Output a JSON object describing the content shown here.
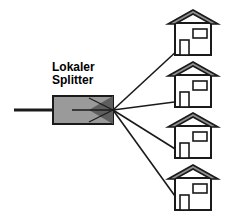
{
  "diagram": {
    "title": "Lokaler Splitter",
    "type": "optical-splitter-network",
    "canvas": {
      "width": 228,
      "height": 218,
      "background": "#ffffff"
    },
    "label": {
      "line1": "Lokaler",
      "line2": "Splitter",
      "x": 52,
      "y": 61,
      "font_size": 12,
      "font_weight": "bold",
      "color": "#000000"
    },
    "colors": {
      "stroke": "#1a1a1a",
      "splitter_fill": "#9a9a9a",
      "splitter_wedge_fill": "#5e5e5e",
      "roof_fill": "#8f8f8f",
      "house_fill": "#ffffff",
      "background": "#ffffff"
    },
    "feeder_line": {
      "label": "feeder-fiber",
      "x1": 14,
      "y1": 110,
      "x2": 70,
      "y2": 110,
      "width": 3
    },
    "splitter_box": {
      "label": "Lokaler Splitter",
      "x": 52,
      "y": 95,
      "width": 61,
      "height": 29,
      "fill": "#9a9a9a",
      "stroke_width": 2
    },
    "splitter_wedge": {
      "apex_x": 113,
      "apex_y": 110,
      "base_x": 113,
      "base_top_y": 95,
      "base_bottom_y": 124
    },
    "drop_lines": [
      {
        "name": "drop-line-1",
        "x1": 113,
        "y1": 110,
        "x2": 178,
        "y2": 48
      },
      {
        "name": "drop-line-2",
        "x1": 113,
        "y1": 110,
        "x2": 178,
        "y2": 100
      },
      {
        "name": "drop-line-3",
        "x1": 113,
        "y1": 110,
        "x2": 178,
        "y2": 150
      },
      {
        "name": "drop-line-4",
        "x1": 113,
        "y1": 110,
        "x2": 178,
        "y2": 202
      }
    ],
    "houses": [
      {
        "name": "house-1",
        "x": 168,
        "y": 10,
        "width": 48,
        "height": 45
      },
      {
        "name": "house-2",
        "x": 168,
        "y": 62,
        "width": 48,
        "height": 45
      },
      {
        "name": "house-3",
        "x": 168,
        "y": 112,
        "width": 48,
        "height": 45
      },
      {
        "name": "house-4",
        "x": 168,
        "y": 164,
        "width": 48,
        "height": 45
      }
    ],
    "house_parts": {
      "roof": "roof-shape",
      "body": "house-body",
      "window": "house-window",
      "door": "house-door"
    }
  }
}
